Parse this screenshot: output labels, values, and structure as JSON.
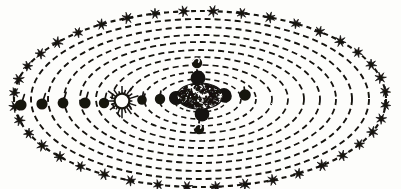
{
  "figure": {
    "style": "woodcut-engraving",
    "background_color": "#fdfdfb",
    "ink_color": "#141210",
    "width": 401,
    "height": 189
  },
  "geometry": {
    "center_x": 200,
    "center_y": 99,
    "outer_rx": 186,
    "outer_ry": 88,
    "ring_count": 11,
    "ring_aspect": 0.473
  },
  "rings": [
    {
      "index": 0,
      "name": "outermost-sphere-of-fixed-stars",
      "rx": 186,
      "ry": 88,
      "dash": "5 4",
      "stroke_width": 2.1,
      "has_stars": true
    },
    {
      "index": 1,
      "name": "ring-2",
      "rx": 169,
      "ry": 80,
      "dash": "6 4",
      "stroke_width": 1.9,
      "has_stars": false
    },
    {
      "index": 2,
      "name": "ring-3",
      "rx": 152,
      "ry": 72,
      "dash": "6 4",
      "stroke_width": 1.9,
      "has_stars": false
    },
    {
      "index": 3,
      "name": "ring-4",
      "rx": 136,
      "ry": 64,
      "dash": "6 4",
      "stroke_width": 1.8,
      "has_stars": false
    },
    {
      "index": 4,
      "name": "ring-5",
      "rx": 120,
      "ry": 57,
      "dash": "6 4",
      "stroke_width": 1.8,
      "has_stars": false
    },
    {
      "index": 5,
      "name": "ring-6",
      "rx": 104,
      "ry": 49,
      "dash": "6 4",
      "stroke_width": 1.8,
      "has_stars": false
    },
    {
      "index": 6,
      "name": "ring-7",
      "rx": 88,
      "ry": 42,
      "dash": "6 4",
      "stroke_width": 1.7,
      "has_stars": false
    },
    {
      "index": 7,
      "name": "ring-8",
      "rx": 72,
      "ry": 34,
      "dash": "6 4",
      "stroke_width": 1.7,
      "has_stars": false
    },
    {
      "index": 8,
      "name": "ring-9",
      "rx": 56,
      "ry": 27,
      "dash": "5 4",
      "stroke_width": 1.7,
      "has_stars": false
    },
    {
      "index": 9,
      "name": "ring-10",
      "rx": 41,
      "ry": 20,
      "dash": "5 4",
      "stroke_width": 1.6,
      "has_stars": false
    },
    {
      "index": 10,
      "name": "innermost-ring",
      "rx": 27,
      "ry": 13,
      "dash": "4 3",
      "stroke_width": 1.5,
      "has_stars": false
    }
  ],
  "stars": {
    "label": "fixed stars on outermost sphere",
    "count": 40,
    "points": 7,
    "outer_radius": 5.2,
    "inner_radius": 1.9,
    "angles_deg": [
      4,
      13,
      22,
      31,
      40,
      49,
      58,
      67,
      76,
      85,
      94,
      103,
      112,
      121,
      130,
      139,
      148,
      157,
      166,
      175,
      184,
      193,
      202,
      211,
      220,
      229,
      238,
      247,
      256,
      265,
      274,
      283,
      292,
      301,
      310,
      319,
      328,
      337,
      346,
      355
    ]
  },
  "bodies": [
    {
      "name": "planet-outer-1",
      "x": 21,
      "y": 105,
      "r": 5.6,
      "tick": true,
      "tick_len": 11,
      "tick_angle": -72
    },
    {
      "name": "planet-outer-2",
      "x": 42,
      "y": 104,
      "r": 5.6,
      "tick": true,
      "tick_len": 11,
      "tick_angle": -72
    },
    {
      "name": "planet-outer-3",
      "x": 63,
      "y": 103,
      "r": 5.4,
      "tick": true,
      "tick_len": 11,
      "tick_angle": -74
    },
    {
      "name": "planet-outer-4",
      "x": 85,
      "y": 103,
      "r": 5.6,
      "tick": true,
      "tick_len": 11,
      "tick_angle": -74
    },
    {
      "name": "planet-outer-5",
      "x": 104,
      "y": 103,
      "r": 5.2,
      "tick": true,
      "tick_len": 10,
      "tick_angle": -76
    },
    {
      "name": "planet-inner-1",
      "x": 121,
      "y": 102,
      "r": 4.4,
      "tick": true,
      "tick_len": 9,
      "tick_angle": -78
    },
    {
      "name": "planet-mercury",
      "x": 142,
      "y": 100,
      "r": 4.8,
      "tick": true,
      "tick_len": 8,
      "tick_angle": -80
    },
    {
      "name": "planet-venus",
      "x": 160,
      "y": 99,
      "r": 5.2,
      "tick": true,
      "tick_len": 8,
      "tick_angle": -84
    },
    {
      "name": "planet-left-of-core",
      "x": 176,
      "y": 98,
      "r": 6.6,
      "tick": false,
      "tick_len": 0,
      "tick_angle": 0
    },
    {
      "name": "planet-right-of-core",
      "x": 225,
      "y": 96,
      "r": 6.8,
      "tick": false,
      "tick_len": 0,
      "tick_angle": 0
    },
    {
      "name": "planet-far-right",
      "x": 245,
      "y": 95,
      "r": 5.8,
      "tick": true,
      "tick_len": 8,
      "tick_angle": -96
    }
  ],
  "core": {
    "name": "central-hatched-core",
    "x": 200,
    "y": 96,
    "rx": 23,
    "ry": 13,
    "texture": "dense-crosshatch-scribble",
    "satellites": [
      {
        "name": "core-satellite-north",
        "x": 198,
        "y": 78,
        "r": 7.4
      },
      {
        "name": "core-satellite-south",
        "x": 202,
        "y": 114,
        "r": 7.4
      },
      {
        "name": "core-satellite-west",
        "x": 176,
        "y": 98,
        "r": 7.0
      },
      {
        "name": "core-satellite-east",
        "x": 224,
        "y": 95,
        "r": 7.0
      }
    ]
  },
  "moons": [
    {
      "name": "moon-north-hooked",
      "x": 197,
      "y": 63,
      "r": 5.2,
      "hook": true
    },
    {
      "name": "moon-south-hooked",
      "x": 199,
      "y": 129,
      "r": 5.2,
      "hook": true
    }
  ],
  "sun": {
    "name": "sun-symbol",
    "x": 122,
    "y": 101,
    "disc_radius": 7.4,
    "ray_count": 20,
    "ray_inner": 7.6,
    "ray_outer": 11.5,
    "fill": "#fdfdfb",
    "stroke": "#141210"
  },
  "spokes": [
    {
      "name": "spoke-core-to-north",
      "x1": 198,
      "y1": 86,
      "x2": 197,
      "y2": 70
    },
    {
      "name": "spoke-core-to-south",
      "x1": 201,
      "y1": 107,
      "x2": 199,
      "y2": 123
    }
  ]
}
